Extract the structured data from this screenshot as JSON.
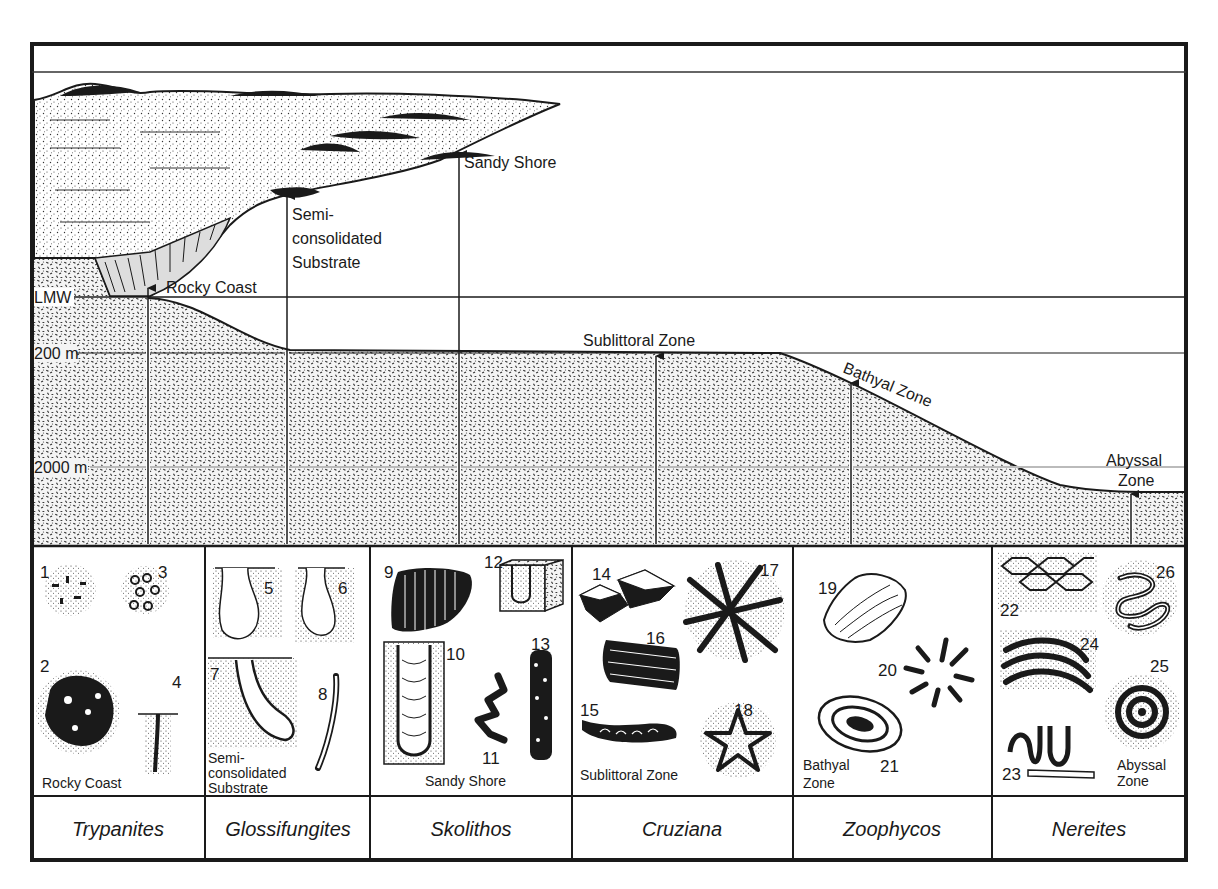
{
  "diagram": {
    "colors": {
      "ink": "#1a1a1a",
      "paper": "#ffffff",
      "sediment_dot": "#2a2a2a"
    },
    "depth_labels": {
      "lmw": "LMW",
      "d200": "200 m",
      "d2000": "2000 m"
    },
    "environment_labels": {
      "sandy_shore": "Sandy Shore",
      "semi_line1": "Semi-",
      "semi_line2": "consolidated",
      "semi_line3": "Substrate",
      "rocky_coast": "Rocky Coast",
      "sublittoral": "Sublittoral Zone",
      "bathyal": "Bathyal Zone",
      "abyssal_line1": "Abyssal",
      "abyssal_line2": "Zone"
    },
    "panels": [
      {
        "facies": "Trypanites",
        "zone_lines": [
          "Rocky Coast"
        ],
        "trace_numbers": [
          "1",
          "2",
          "3",
          "4"
        ]
      },
      {
        "facies": "Glossifungites",
        "zone_lines": [
          "Semi-",
          "consolidated",
          "Substrate"
        ],
        "trace_numbers": [
          "5",
          "6",
          "7",
          "8"
        ]
      },
      {
        "facies": "Skolithos",
        "zone_lines": [
          "Sandy Shore"
        ],
        "trace_numbers": [
          "9",
          "10",
          "11",
          "12",
          "13"
        ]
      },
      {
        "facies": "Cruziana",
        "zone_lines": [
          "Sublittoral Zone"
        ],
        "trace_numbers": [
          "14",
          "15",
          "16",
          "17",
          "18"
        ]
      },
      {
        "facies": "Zoophycos",
        "zone_lines": [
          "Bathyal",
          "Zone"
        ],
        "trace_numbers": [
          "19",
          "20",
          "21"
        ]
      },
      {
        "facies": "Nereites",
        "zone_lines": [
          "Abyssal",
          "Zone"
        ],
        "trace_numbers": [
          "22",
          "23",
          "24",
          "25",
          "26"
        ]
      }
    ]
  }
}
